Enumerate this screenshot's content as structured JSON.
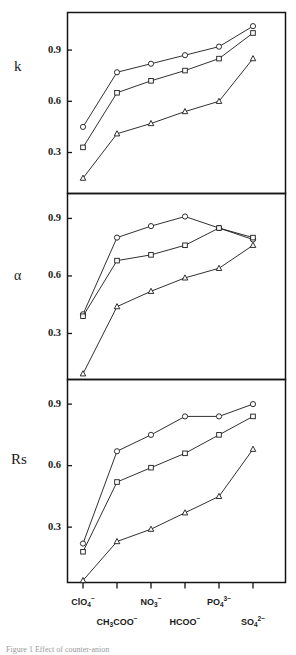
{
  "figure": {
    "caption_fragment": "Figure 1 Effect of counter-anion",
    "panel_label_k": "k",
    "panel_label_alpha": "α",
    "panel_label_rs": "Rs"
  },
  "axis": {
    "y_ticks": [
      "0.9",
      "0.6",
      "0.3"
    ],
    "y_tick_values": [
      0.9,
      0.6,
      0.3
    ],
    "x_categories_row1": [
      "ClO4-",
      "",
      "NO3-",
      "",
      "PO43-",
      ""
    ],
    "x_categories_row2": [
      "",
      "CH3COO-",
      "",
      "HCOO-",
      "",
      "SO42-"
    ]
  },
  "chart_data": [
    {
      "type": "line",
      "title": "k",
      "xlabel": "",
      "ylabel": "k",
      "categories": [
        "ClO4-",
        "CH3COO-",
        "NO3-",
        "HCOO-",
        "PO43-",
        "SO42-"
      ],
      "category_labels": [
        "ClO₄⁻",
        "CH₃COO⁻",
        "NO₃⁻",
        "HCOO⁻",
        "PO₄³⁻",
        "SO₄²⁻"
      ],
      "ylim": [
        0.06,
        1.12
      ],
      "yticks": [
        0.3,
        0.6,
        0.9
      ],
      "grid": false,
      "legend": "none",
      "series": [
        {
          "name": "circle",
          "marker": "open-circle",
          "values": [
            0.45,
            0.77,
            0.82,
            0.87,
            0.92,
            1.04
          ]
        },
        {
          "name": "square",
          "marker": "open-square",
          "values": [
            0.33,
            0.65,
            0.72,
            0.78,
            0.85,
            1.0
          ]
        },
        {
          "name": "triangle",
          "marker": "open-triangle",
          "values": [
            0.15,
            0.41,
            0.47,
            0.54,
            0.6,
            0.85
          ]
        }
      ]
    },
    {
      "type": "line",
      "title": "alpha",
      "xlabel": "",
      "ylabel": "α",
      "categories": [
        "ClO4-",
        "CH3COO-",
        "NO3-",
        "HCOO-",
        "PO43-",
        "SO42-"
      ],
      "category_labels": [
        "ClO₄⁻",
        "CH₃COO⁻",
        "NO₃⁻",
        "HCOO⁻",
        "PO₄³⁻",
        "SO₄²⁻"
      ],
      "ylim": [
        0.06,
        1.03
      ],
      "yticks": [
        0.3,
        0.6,
        0.9
      ],
      "grid": false,
      "legend": "none",
      "series": [
        {
          "name": "circle",
          "marker": "open-circle",
          "values": [
            0.4,
            0.8,
            0.86,
            0.91,
            0.85,
            0.79
          ]
        },
        {
          "name": "square",
          "marker": "open-square",
          "values": [
            0.39,
            0.68,
            0.71,
            0.76,
            0.85,
            0.8
          ]
        },
        {
          "name": "triangle",
          "marker": "open-triangle",
          "values": [
            0.09,
            0.44,
            0.52,
            0.59,
            0.64,
            0.76
          ]
        }
      ]
    },
    {
      "type": "line",
      "title": "Rs",
      "xlabel": "",
      "ylabel": "Rs",
      "categories": [
        "ClO4-",
        "CH3COO-",
        "NO3-",
        "HCOO-",
        "PO43-",
        "SO42-"
      ],
      "category_labels": [
        "ClO₄⁻",
        "CH₃COO⁻",
        "NO₃⁻",
        "HCOO⁻",
        "PO₄³⁻",
        "SO₄²⁻"
      ],
      "ylim": [
        0.03,
        1.02
      ],
      "yticks": [
        0.3,
        0.6,
        0.9
      ],
      "grid": false,
      "legend": "none",
      "series": [
        {
          "name": "circle",
          "marker": "open-circle",
          "values": [
            0.22,
            0.67,
            0.75,
            0.84,
            0.84,
            0.9
          ]
        },
        {
          "name": "square",
          "marker": "open-square",
          "values": [
            0.18,
            0.52,
            0.59,
            0.66,
            0.75,
            0.84
          ]
        },
        {
          "name": "triangle",
          "marker": "open-triangle",
          "values": [
            0.04,
            0.23,
            0.29,
            0.37,
            0.45,
            0.68
          ]
        }
      ]
    }
  ]
}
